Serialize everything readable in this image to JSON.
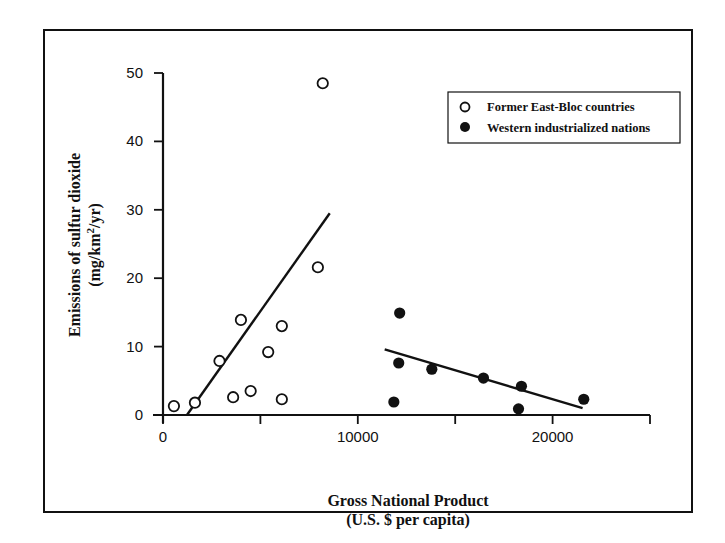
{
  "chart_data": {
    "type": "scatter",
    "title": "",
    "xlabel": "Gross National Product",
    "xlabel_sub": "(U.S. $ per capita)",
    "ylabel": "Emissions of sulfur dioxide",
    "ylabel_sub": "(mg/km²/yr)",
    "xlim": [
      0,
      25000
    ],
    "ylim": [
      0,
      50
    ],
    "x_ticks": [
      0,
      5000,
      10000,
      15000,
      20000,
      25000
    ],
    "x_tick_labels": [
      "0",
      "",
      "10000",
      "",
      "20000",
      ""
    ],
    "y_ticks": [
      0,
      10,
      20,
      30,
      40,
      50
    ],
    "y_tick_labels": [
      "0",
      "10",
      "20",
      "30",
      "40",
      "50"
    ],
    "grid": false,
    "legend_position": "upper right",
    "series": [
      {
        "name": "Former East-Bloc countries",
        "marker": "open-circle",
        "points": [
          [
            560,
            1.3
          ],
          [
            1640,
            1.8
          ],
          [
            2900,
            7.9
          ],
          [
            3600,
            2.6
          ],
          [
            4000,
            13.9
          ],
          [
            4500,
            3.5
          ],
          [
            5400,
            9.2
          ],
          [
            6100,
            13.0
          ],
          [
            6100,
            2.3
          ],
          [
            7950,
            21.6
          ],
          [
            8200,
            48.5
          ]
        ],
        "trendline": [
          [
            1230,
            0
          ],
          [
            8560,
            29.5
          ]
        ]
      },
      {
        "name": "Western industrialized nations",
        "marker": "filled-circle",
        "points": [
          [
            11850,
            1.9
          ],
          [
            12100,
            7.6
          ],
          [
            12150,
            14.9
          ],
          [
            13800,
            6.7
          ],
          [
            16450,
            5.4
          ],
          [
            18250,
            0.9
          ],
          [
            18400,
            4.2
          ],
          [
            21600,
            2.3
          ]
        ],
        "trendline": [
          [
            11380,
            9.6
          ],
          [
            21540,
            1.0
          ]
        ]
      }
    ]
  },
  "legend": {
    "items": [
      {
        "label": "Former East-Bloc countries",
        "marker": "open-circle"
      },
      {
        "label": "Western industrialized nations",
        "marker": "filled-circle"
      }
    ]
  },
  "axes": {
    "x": {
      "title": "Gross National Product",
      "subtitle": "(U.S. $ per capita)"
    },
    "y": {
      "title": "Emissions of sulfur dioxide",
      "subtitle_pre": "(mg/km",
      "subtitle_sup": "2",
      "subtitle_post": "/yr)"
    }
  }
}
